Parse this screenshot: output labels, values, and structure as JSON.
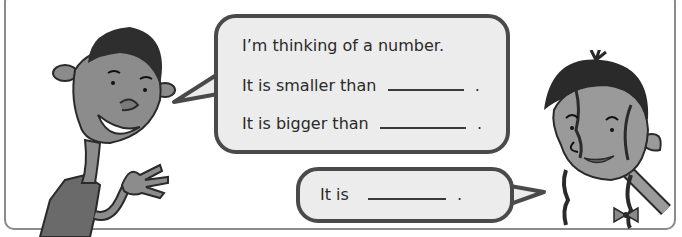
{
  "scene": {
    "frame_color": "#8a8a8a",
    "bubble_fill": "#ececec",
    "bubble_border": "#4a4a4a"
  },
  "speech_bubble_1": {
    "lines": [
      {
        "text": "I’m thinking of a number.",
        "blank": false,
        "end": ""
      },
      {
        "text": "It is smaller than",
        "blank": true,
        "end": "."
      },
      {
        "text": "It is bigger than",
        "blank": true,
        "end": "."
      }
    ]
  },
  "speech_bubble_2": {
    "text": "It is",
    "blank": true,
    "end": "."
  },
  "characters": [
    {
      "name": "boy",
      "description": "smiling boy waving hand"
    },
    {
      "name": "girl",
      "description": "smiling girl with braids and bow"
    }
  ]
}
